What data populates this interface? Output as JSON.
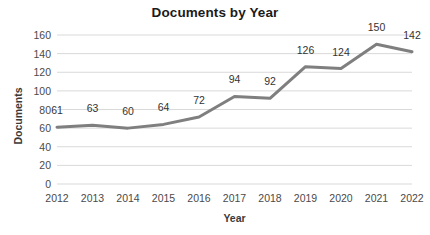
{
  "chart_data": {
    "type": "line",
    "title": "Documents by Year",
    "xlabel": "Year",
    "ylabel": "Documents",
    "categories": [
      "2012",
      "2013",
      "2014",
      "2015",
      "2016",
      "2017",
      "2018",
      "2019",
      "2020",
      "2021",
      "2022"
    ],
    "values": [
      61,
      63,
      60,
      64,
      72,
      94,
      92,
      126,
      124,
      150,
      142
    ],
    "data_labels": [
      "61",
      "63",
      "60",
      "64",
      "72",
      "94",
      "92",
      "126",
      "124",
      "150",
      "142"
    ],
    "ylim": [
      0,
      160
    ],
    "ytick_values": [
      0,
      20,
      40,
      60,
      80,
      100,
      120,
      140,
      160
    ],
    "ytick_labels": [
      "0",
      "20",
      "40",
      "60",
      "80",
      "100",
      "120",
      "140",
      "160"
    ],
    "grid": true,
    "grid_axis": "y",
    "legend": false,
    "markers": false,
    "series_color": "#7f7f7f",
    "grid_color": "#d9d9d9",
    "label_color": "#333333",
    "background_color": "#ffffff"
  }
}
